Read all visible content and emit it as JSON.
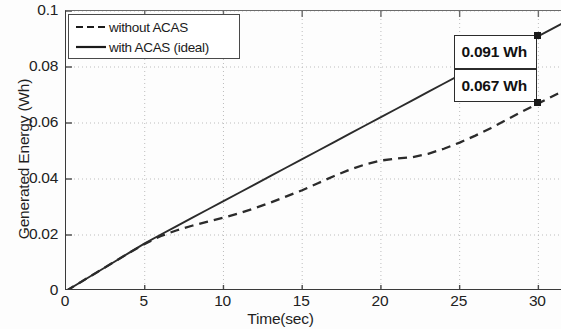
{
  "figure": {
    "background_color": "#fdfdfd",
    "line_color": "#2b2b2b",
    "grid_color": "#bdbdbd"
  },
  "axes": {
    "x_title": "Time(sec)",
    "y_title": "Generated Energy (Wh)",
    "x_ticks": [
      "0",
      "5",
      "10",
      "15",
      "20",
      "25",
      "30"
    ],
    "y_ticks": [
      "0",
      "0.02",
      "0.04",
      "0.06",
      "0.08",
      "0.1"
    ]
  },
  "legend": {
    "entries": [
      {
        "label": "without ACAS",
        "style": "dashed"
      },
      {
        "label": "with ACAS (ideal)",
        "style": "solid"
      }
    ]
  },
  "annotations": {
    "ideal_value": "0.091 Wh",
    "plain_value": "0.067 Wh"
  },
  "chart_data": {
    "type": "line",
    "title": "",
    "xlabel": "Time(sec)",
    "ylabel": "Generated Energy (Wh)",
    "xlim": [
      0,
      31.5
    ],
    "ylim": [
      0,
      0.1
    ],
    "xticks": [
      0,
      5,
      10,
      15,
      20,
      25,
      30
    ],
    "yticks": [
      0,
      0.02,
      0.04,
      0.06,
      0.08,
      0.1
    ],
    "grid": true,
    "grid_style": "dotted",
    "legend_position": "upper left",
    "x": [
      0,
      1,
      2,
      3,
      4,
      5,
      6,
      7,
      8,
      9,
      10,
      11,
      12,
      13,
      14,
      15,
      16,
      17,
      18,
      19,
      20,
      21,
      22,
      23,
      24,
      25,
      26,
      27,
      28,
      29,
      30,
      31.5
    ],
    "series": [
      {
        "name": "with ACAS (ideal)",
        "style": "solid",
        "end_label": "0.091 Wh",
        "end_point": [
          30,
          0.091
        ],
        "values": [
          0.0,
          0.0034,
          0.0068,
          0.0102,
          0.0136,
          0.017,
          0.0201,
          0.0231,
          0.0261,
          0.0291,
          0.0321,
          0.0351,
          0.0381,
          0.0411,
          0.0441,
          0.0471,
          0.0501,
          0.0531,
          0.0561,
          0.0591,
          0.0621,
          0.0651,
          0.0681,
          0.0711,
          0.0741,
          0.0771,
          0.0801,
          0.0829,
          0.0857,
          0.0884,
          0.091,
          0.0955
        ]
      },
      {
        "name": "without ACAS",
        "style": "dashed",
        "end_label": "0.067 Wh",
        "end_point": [
          30,
          0.067
        ],
        "values": [
          0.0,
          0.0034,
          0.0068,
          0.0102,
          0.0136,
          0.0168,
          0.0196,
          0.0216,
          0.0233,
          0.0248,
          0.0262,
          0.0278,
          0.0296,
          0.0316,
          0.0338,
          0.036,
          0.0385,
          0.041,
          0.0433,
          0.0452,
          0.0466,
          0.0473,
          0.0478,
          0.049,
          0.0508,
          0.053,
          0.0555,
          0.0582,
          0.0612,
          0.0642,
          0.067,
          0.0712
        ]
      }
    ],
    "markers": [
      {
        "series": "with ACAS (ideal)",
        "x": 30,
        "y": 0.091,
        "shape": "square"
      },
      {
        "series": "without ACAS",
        "x": 30,
        "y": 0.067,
        "shape": "square"
      }
    ]
  }
}
